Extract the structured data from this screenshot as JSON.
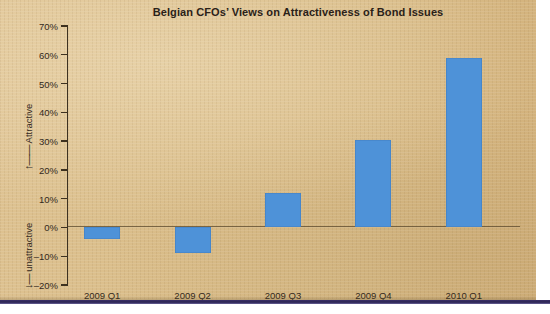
{
  "chart_data": {
    "type": "bar",
    "title": "Belgian CFOs’ Views on Attractiveness of Bond Issues",
    "categories": [
      "2009 Q1",
      "2009 Q2",
      "2009 Q3",
      "2009 Q4",
      "2010 Q1"
    ],
    "values": [
      -4,
      -9,
      12,
      30.5,
      59
    ],
    "xlabel": "",
    "ylabel": "",
    "ylim": [
      -20,
      70
    ],
    "ytick_step": 10,
    "ytick_labels": [
      "70%",
      "60%",
      "50%",
      "40%",
      "30%",
      "20%",
      "10%",
      "0%",
      "–10%",
      "–20%"
    ],
    "ytick_values": [
      70,
      60,
      50,
      40,
      30,
      20,
      10,
      0,
      -10,
      -20
    ],
    "grid": false,
    "legend": false,
    "zero_line": true,
    "axis_direction_labels": {
      "positive": "Attractive",
      "negative": "unattractive",
      "positive_arrow": "↑",
      "negative_arrow": "↓"
    },
    "series_color": "#4e92d8"
  },
  "page": {
    "background_color": "#dabd89",
    "rule_color": "#2b2352",
    "text_color": "#33291c"
  }
}
